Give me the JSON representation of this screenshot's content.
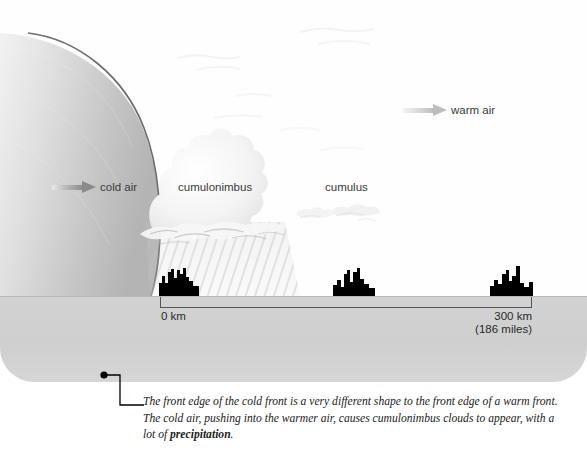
{
  "diagram": {
    "labels": {
      "cold_air": "cold air",
      "cumulonimbus": "cumulonimbus",
      "cumulus": "cumulus",
      "warm_air": "warm air"
    },
    "scale": {
      "left_label": "0 km",
      "right_label_km": "300 km",
      "right_label_miles": "(186 miles)"
    },
    "caption": {
      "text_1": "The front edge of the cold front is a very different shape to the front edge of a warm front. The cold air, pushing into the warmer air, causes cumulonimbus clouds to appear, with a lot of ",
      "bold_term": "precipitation",
      "text_2": "."
    }
  },
  "colors": {
    "ground": "#d2d2d2",
    "cold_air_mass": "#c9c9c9",
    "front_edge_line": "#6e6e6e",
    "arrow_cold": "#8a8a8a",
    "arrow_warm": "#bdbdbd",
    "city_silhouette": "#000000",
    "rain_streak": "#b8b8b8",
    "text": "#3a3a3a"
  }
}
